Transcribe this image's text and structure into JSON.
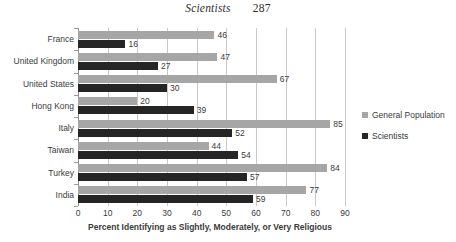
{
  "running_head": {
    "title": "Scientists",
    "page_number": "287"
  },
  "legend": {
    "position": "right",
    "items": [
      {
        "label": "General Population",
        "color": "#a6a6a6",
        "key": "general"
      },
      {
        "label": "Scientists",
        "color": "#252525",
        "key": "scientists"
      }
    ]
  },
  "chart_data": {
    "type": "bar",
    "orientation": "horizontal",
    "title": "",
    "xlabel": "Percent Identifying as Slightly, Moderately, or Very Religious",
    "ylabel": "",
    "xlim": [
      0,
      90
    ],
    "xticks": [
      0,
      10,
      20,
      30,
      40,
      50,
      60,
      70,
      80,
      90
    ],
    "xtick_labels": [
      "0",
      "10",
      "20",
      "30",
      "40",
      "50",
      "60",
      "70",
      "80",
      "90"
    ],
    "grid": "vertical",
    "legend_position": "right",
    "categories": [
      "France",
      "United Kingdom",
      "United States",
      "Hong Kong",
      "Italy",
      "Taiwan",
      "Turkey",
      "India"
    ],
    "series": [
      {
        "name": "General Population",
        "color": "#a6a6a6",
        "values": [
          46,
          47,
          67,
          20,
          85,
          44,
          84,
          77
        ],
        "value_labels": [
          "46",
          "47",
          "67",
          "20",
          "85",
          "44",
          "84",
          "77"
        ]
      },
      {
        "name": "Scientists",
        "color": "#252525",
        "values": [
          16,
          27,
          30,
          39,
          52,
          54,
          57,
          59
        ],
        "value_labels": [
          "16",
          "27",
          "30",
          "39",
          "52",
          "54",
          "57",
          "59"
        ]
      }
    ]
  },
  "colors": {
    "general_population": "#a6a6a6",
    "scientists": "#252525",
    "gridline": "#c9c9c9",
    "axis": "#8f8f8f",
    "text": "#3b3b3b",
    "background": "#ffffff"
  }
}
